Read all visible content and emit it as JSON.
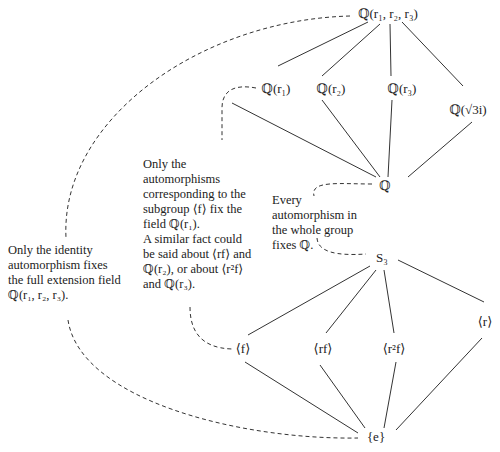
{
  "fields": {
    "top": "ℚ(r₁, r₂, r₃)",
    "q_r1": "ℚ(r₁)",
    "q_r2": "ℚ(r₂)",
    "q_r3": "ℚ(r₃)",
    "q_sqrt3i": "ℚ(√3i)",
    "q": "ℚ"
  },
  "groups": {
    "s3": "S₃",
    "f": "⟨f⟩",
    "rf": "⟨rf⟩",
    "r2f": "⟨r²f⟩",
    "r": "⟨r⟩",
    "e": "{e}"
  },
  "notes": {
    "identity": [
      "Only the identity",
      "automorphism fixes",
      "the full extension field",
      "ℚ(r₁, r₂, r₃)."
    ],
    "subgroup": [
      "Only the",
      "automorphisms",
      "corresponding to the",
      "subgroup ⟨f⟩ fix the",
      "field ℚ(r₁).",
      "A similar fact could",
      "be said about ⟨rf⟩ and",
      "ℚ(r₂), or about ⟨r²f⟩",
      "and ℚ(r₃)."
    ],
    "whole_group": [
      "Every",
      "automorphism in",
      "the whole group",
      "fixes ℚ."
    ]
  }
}
